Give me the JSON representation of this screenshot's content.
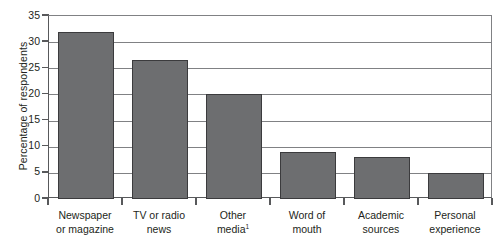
{
  "chart_data": {
    "type": "bar",
    "title": "",
    "xlabel": "",
    "ylabel": "Percentage of respondents",
    "categories": [
      "Newspaper or magazine",
      "TV or radio news",
      "Other media¹",
      "Word of mouth",
      "Academic sources",
      "Personal experience"
    ],
    "category_lines": [
      [
        "Newspaper",
        "or magazine"
      ],
      [
        "TV or radio",
        "news"
      ],
      [
        "Other",
        "media"
      ],
      [
        "Word of",
        "mouth"
      ],
      [
        "Academic",
        "sources"
      ],
      [
        "Personal",
        "experience"
      ]
    ],
    "values": [
      32,
      26.5,
      20,
      9,
      8,
      5
    ],
    "ylim": [
      0,
      35
    ],
    "ytick_values": [
      0,
      5,
      10,
      15,
      20,
      25,
      30,
      35
    ],
    "ytick_labels": [
      "0",
      "5",
      "10",
      "15",
      "20",
      "25",
      "30",
      "35"
    ],
    "grid": true,
    "grid_axis": "y",
    "legend": "none",
    "footnote_marker": "1",
    "colors": {
      "bar_fill": "#6d6e70",
      "bar_edge": "#3b3b3d",
      "grid": "#808184",
      "axis": "#58595b",
      "text": "#231f20",
      "background": "#ffffff"
    }
  }
}
